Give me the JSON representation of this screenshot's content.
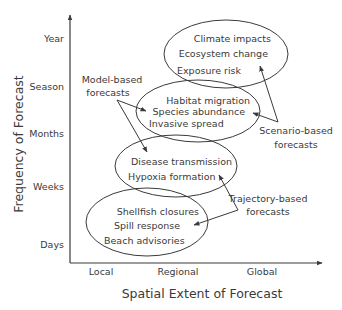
{
  "diagram": {
    "y_axis": {
      "title": "Frequency of Forecast",
      "ticks": [
        "Year",
        "Season",
        "Months",
        "Weeks",
        "Days"
      ]
    },
    "x_axis": {
      "title": "Spatial Extent of Forecast",
      "ticks": [
        "Local",
        "Regional",
        "Global"
      ]
    },
    "ellipses": [
      {
        "id": "climate",
        "labels": [
          "Climate impacts",
          "Ecosystem change",
          "Exposure risk"
        ]
      },
      {
        "id": "habitat",
        "labels": [
          "Habitat migration",
          "Species abundance",
          "Invasive spread"
        ]
      },
      {
        "id": "disease",
        "labels": [
          "Disease transmission",
          "Hypoxia formation"
        ]
      },
      {
        "id": "shellfish",
        "labels": [
          "Shellfish closures",
          "Spill response",
          "Beach advisories"
        ]
      }
    ],
    "callouts": {
      "model_based": [
        "Model-based",
        "forecasts"
      ],
      "scenario_based": [
        "Scenario-based",
        "forecasts"
      ],
      "trajectory_based": [
        "Trajectory-based",
        "forecasts"
      ]
    },
    "colors": {
      "stroke": "#3a3a3a",
      "text": "#3a3a3a",
      "background": "#ffffff"
    }
  }
}
